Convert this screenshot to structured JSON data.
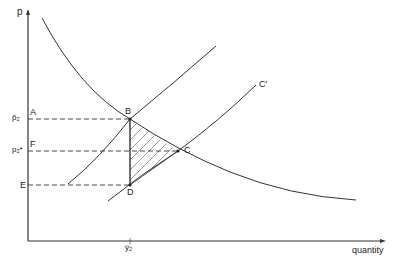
{
  "diagram": {
    "axes": {
      "y_label": "p",
      "x_label": "quantity"
    },
    "price_labels": [
      {
        "symbol": "p̂₂",
        "point": "A"
      },
      {
        "symbol": "p₂*",
        "point": "F"
      },
      {
        "symbol": "",
        "point": "E"
      }
    ],
    "x_tick_label": "ŷ₂",
    "curves": {
      "demand": "",
      "supply": "",
      "shifted_supply": "C′"
    },
    "points": [
      "A",
      "B",
      "C",
      "D",
      "E",
      "F"
    ],
    "shaded_region": "BCD",
    "colors": {
      "line": "#333333",
      "background": "#ffffff"
    }
  }
}
